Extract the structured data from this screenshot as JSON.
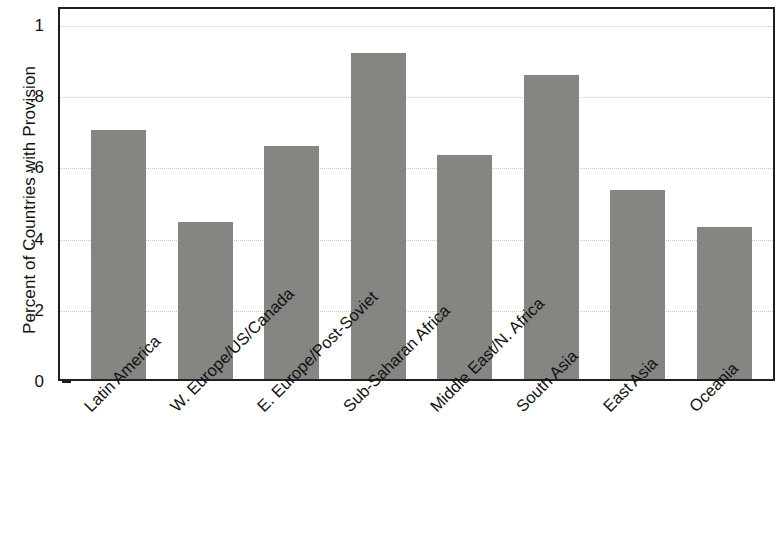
{
  "chart_data": {
    "type": "bar",
    "title": "",
    "xlabel": "",
    "ylabel": "Percent of Countries with Provision",
    "categories": [
      "Latin America",
      "W. Europe/US/Canada",
      "E. Europe/Post-Soviet",
      "Sub-Saharan Africa",
      "Middle East/N. Africa",
      "South Asia",
      "East Asia",
      "Oceania"
    ],
    "values": [
      0.7,
      0.44,
      0.655,
      0.915,
      0.63,
      0.855,
      0.53,
      0.428
    ],
    "ylim": [
      0,
      1
    ],
    "yticks": [
      0,
      0.2,
      0.4,
      0.6,
      0.8,
      1
    ],
    "ytick_labels": [
      "0",
      ".2",
      ".4",
      ".6",
      ".8",
      "1"
    ],
    "grid": true,
    "legend": "none",
    "bar_color": "#82827f",
    "axis_color": "#1f1f1f",
    "gridline_color": "#c8c8c8"
  }
}
